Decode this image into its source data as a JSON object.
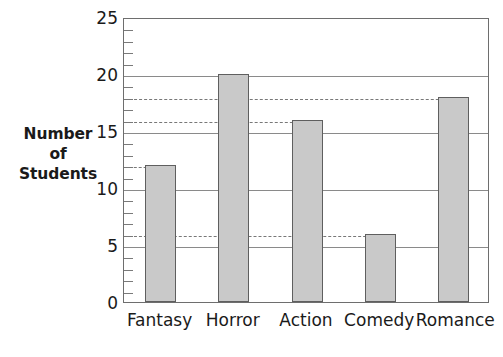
{
  "chart_data": {
    "type": "bar",
    "title": "",
    "xlabel": "",
    "ylabel": "Number of Students",
    "ylabel_lines": [
      "Number",
      "of",
      "Students"
    ],
    "categories": [
      "Fantasy",
      "Horror",
      "Action",
      "Comedy",
      "Romance"
    ],
    "values": [
      12,
      20,
      16,
      6,
      18
    ],
    "ylim": [
      0,
      25
    ],
    "ytick_values": [
      0,
      5,
      10,
      15,
      20,
      25
    ],
    "ytick_labels": [
      "0",
      "5",
      "10",
      "15",
      "20",
      "25"
    ],
    "minor_tick_interval": 1,
    "grid": true,
    "gridlines_at": [
      5,
      10,
      15,
      20,
      25
    ],
    "legend": "none",
    "bar_fill_color": "#c9c9c9",
    "bar_edge_color": "#5f5f5f",
    "gridline_color": "#8a8a8a",
    "dashed_line_color": "#787878",
    "axis_color": "#6e6e6e",
    "text_color": "#1a1a1a",
    "annotations": [
      {
        "name": "dashed-guide-fantasy",
        "value": 12,
        "from_category_index": 0,
        "to_category_index": 0
      },
      {
        "name": "dashed-guide-comedy",
        "value": 6,
        "from_category_index": 0,
        "to_category_index": 3
      },
      {
        "name": "dashed-guide-action",
        "value": 16,
        "from_category_index": 0,
        "to_category_index": 2
      },
      {
        "name": "dashed-guide-romance",
        "value": 18,
        "from_category_index": 0,
        "to_category_index": 4
      }
    ]
  }
}
